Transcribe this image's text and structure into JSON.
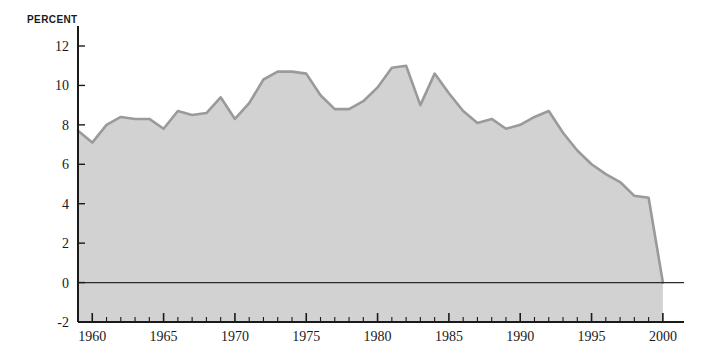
{
  "chart_data": {
    "type": "area",
    "title": "",
    "subtitle": "",
    "xlabel": "",
    "ylabel": "PERCENT",
    "ylim": [
      -2,
      12
    ],
    "xlim": [
      1959,
      2001.2
    ],
    "yticks": [
      -2,
      0,
      2,
      4,
      6,
      8,
      10,
      12
    ],
    "ytick_labels": [
      "-2",
      "0",
      "2",
      "4",
      "6",
      "8",
      "10",
      "12"
    ],
    "xticks": [
      1960,
      1965,
      1970,
      1975,
      1980,
      1985,
      1990,
      1995,
      2000
    ],
    "xtick_labels": [
      "1960",
      "1965",
      "1970",
      "1975",
      "1980",
      "1985",
      "1990",
      "1995",
      "2000"
    ],
    "minor_xtick_interval": 1,
    "grid": false,
    "legend": null,
    "legend_position": "none",
    "zero_line": true,
    "fill_color": "#d2d2d2",
    "line_color": "#9a9a9a",
    "axis_color": "#1a1a1a",
    "x": [
      1959,
      1960,
      1961,
      1962,
      1963,
      1964,
      1965,
      1966,
      1967,
      1968,
      1969,
      1970,
      1971,
      1972,
      1973,
      1974,
      1975,
      1976,
      1977,
      1978,
      1979,
      1980,
      1981,
      1982,
      1983,
      1984,
      1985,
      1986,
      1987,
      1988,
      1989,
      1990,
      1991,
      1992,
      1993,
      1994,
      1995,
      1996,
      1997,
      1998,
      1999,
      2000
    ],
    "values": [
      7.7,
      7.1,
      8.0,
      8.4,
      8.3,
      8.3,
      7.8,
      8.7,
      8.5,
      8.6,
      9.4,
      8.3,
      9.1,
      10.3,
      10.7,
      10.7,
      10.6,
      9.5,
      8.8,
      8.8,
      9.2,
      9.9,
      10.9,
      11.0,
      9.0,
      10.6,
      9.6,
      8.7,
      8.1,
      8.3,
      7.8,
      8.0,
      8.4,
      8.7,
      7.6,
      6.7,
      6.0,
      5.5,
      5.1,
      4.4,
      4.3,
      0.0
    ],
    "series": [
      {
        "name": "percent",
        "values": [
          7.7,
          7.1,
          8.0,
          8.4,
          8.3,
          8.3,
          7.8,
          8.7,
          8.5,
          8.6,
          9.4,
          8.3,
          9.1,
          10.3,
          10.7,
          10.7,
          10.6,
          9.5,
          8.8,
          8.8,
          9.2,
          9.9,
          10.9,
          11.0,
          9.0,
          10.6,
          9.6,
          8.7,
          8.1,
          8.3,
          7.8,
          8.0,
          8.4,
          8.7,
          7.6,
          6.7,
          6.0,
          5.5,
          5.1,
          4.4,
          4.3,
          0.0
        ]
      }
    ],
    "annotations": []
  }
}
